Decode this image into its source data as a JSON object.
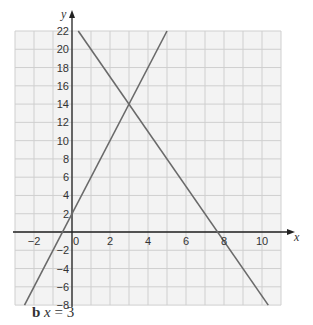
{
  "chart_data": {
    "type": "line",
    "title": "",
    "xlabel": "x",
    "ylabel": "y",
    "xlim": [
      -3,
      11
    ],
    "ylim": [
      -8,
      22
    ],
    "grid": true,
    "x_ticks": [
      -2,
      0,
      2,
      4,
      6,
      8,
      10
    ],
    "y_ticks": [
      -8,
      -6,
      -4,
      -2,
      2,
      4,
      6,
      8,
      10,
      12,
      14,
      16,
      18,
      20,
      22
    ],
    "series": [
      {
        "name": "y = 4x + 2",
        "x": [
          -2.5,
          5
        ],
        "y": [
          -8,
          22
        ]
      },
      {
        "name": "y = -3x + 23",
        "x": [
          0.33,
          10.33
        ],
        "y": [
          22,
          -8
        ]
      }
    ],
    "annotations": [
      {
        "label": "intersection",
        "x": 3,
        "y": 14
      }
    ],
    "colors": {
      "line": "#6a6a6a",
      "grid": "#cfcfcf",
      "background": "#f3f3f3",
      "axis": "#222222"
    }
  },
  "caption": {
    "part": "b",
    "var": "x",
    "eq": " = 3"
  }
}
